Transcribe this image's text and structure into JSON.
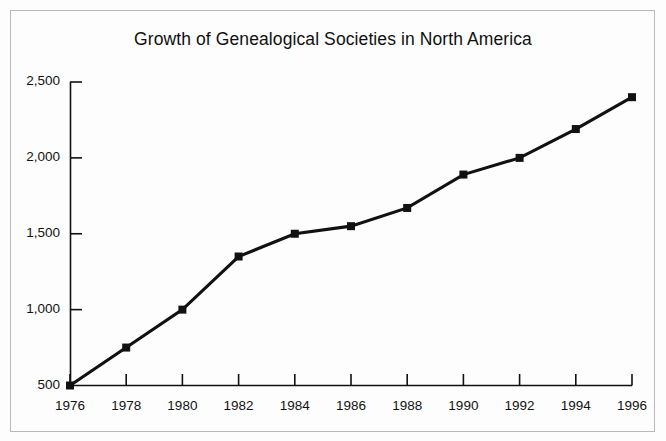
{
  "figure": {
    "background_color": "#fdfdfd",
    "border_color": "#b9b9b9",
    "line_color": "#111111",
    "text_color": "#121212"
  },
  "chart_data": {
    "type": "line",
    "title": "Growth of Genealogical Societies in North America",
    "xlabel": "",
    "ylabel": "",
    "x": [
      1976,
      1978,
      1980,
      1982,
      1984,
      1986,
      1988,
      1990,
      1992,
      1994,
      1996
    ],
    "values": [
      500,
      750,
      1000,
      1350,
      1500,
      1550,
      1670,
      1890,
      2000,
      2190,
      2400
    ],
    "categories": [
      "1976",
      "1978",
      "1980",
      "1982",
      "1984",
      "1986",
      "1988",
      "1990",
      "1992",
      "1994",
      "1996"
    ],
    "xtick_labels": [
      "1976",
      "1978",
      "1980",
      "1982",
      "1984",
      "1986",
      "1988",
      "1990",
      "1992",
      "1994",
      "1996"
    ],
    "ytick_labels": [
      "2,500",
      "2,000",
      "1,500",
      "1,000",
      "500"
    ],
    "ytick_values": [
      2500,
      2000,
      1500,
      1000,
      500
    ],
    "ylim": [
      500,
      2500
    ],
    "xlim": [
      1976,
      1996
    ],
    "grid": false,
    "legend": null,
    "marker": "square",
    "series": [
      {
        "name": "Genealogical Societies",
        "values": [
          500,
          750,
          1000,
          1350,
          1500,
          1550,
          1670,
          1890,
          2000,
          2190,
          2400
        ]
      }
    ]
  }
}
